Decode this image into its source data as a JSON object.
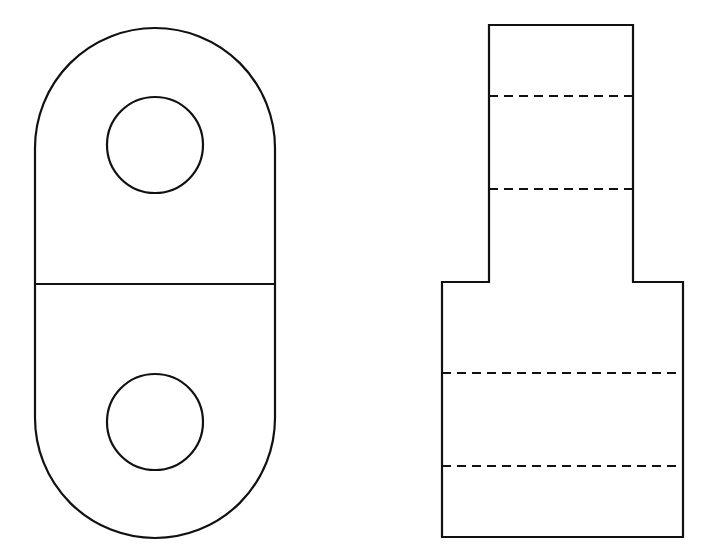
{
  "figure": {
    "type": "orthographic-projection",
    "background": "#ffffff",
    "line_color": "#111111",
    "views": [
      {
        "name": "left-view",
        "shape": "obround",
        "bounds": {
          "left": 35,
          "right": 275,
          "top": 28,
          "bottom": 538
        },
        "arc_radius": 120,
        "divider_line_y": 284,
        "holes": [
          {
            "cx": 155,
            "cy": 145,
            "r": 48
          },
          {
            "cx": 155,
            "cy": 422,
            "r": 48
          }
        ]
      },
      {
        "name": "right-view",
        "shape": "stepped-profile",
        "upper_block": {
          "left": 489,
          "right": 633,
          "top": 25,
          "bottom": 282
        },
        "lower_block": {
          "left": 442,
          "right": 683,
          "top": 282,
          "bottom": 537
        },
        "hidden_lines": [
          {
            "x1": 489,
            "x2": 633,
            "y": 96
          },
          {
            "x1": 489,
            "x2": 633,
            "y": 189
          },
          {
            "x1": 442,
            "x2": 683,
            "y": 373
          },
          {
            "x1": 442,
            "x2": 683,
            "y": 466
          }
        ]
      }
    ]
  }
}
